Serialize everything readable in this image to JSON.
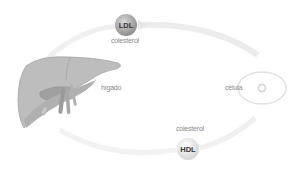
{
  "diagram": {
    "ldl": {
      "label": "LDL",
      "sublabel": "colesterol"
    },
    "hdl": {
      "label": "HDL",
      "sublabel": "colesterol"
    },
    "liver": {
      "label": "hígado"
    },
    "cell": {
      "label": "célula"
    },
    "colors": {
      "arrow": "#ececec",
      "liver_fill": "#bdbdbd",
      "liver_dark": "#9a9a9a",
      "ldl_circle": "#a8a8a8",
      "hdl_circle": "#f0f0f0",
      "text": "#8a8a8a"
    }
  }
}
